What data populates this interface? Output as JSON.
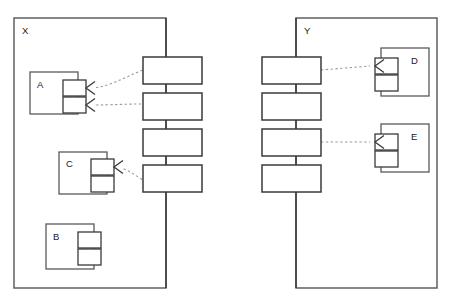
{
  "diagram": {
    "type": "uml-component-diagram",
    "canvas": {
      "width": 456,
      "height": 302,
      "background": "#ffffff"
    },
    "stroke_colors": {
      "container": "#555555",
      "node": "#3a3a3a",
      "component": "#5a5a5a",
      "connector": "#9a9a9a"
    },
    "containers": [
      {
        "id": "container-x",
        "label": "X",
        "x": 14,
        "y": 18,
        "width": 152,
        "height": 270,
        "label_x": 22,
        "label_y": 31
      },
      {
        "id": "container-y",
        "label": "Y",
        "x": 296,
        "y": 18,
        "width": 141,
        "height": 270,
        "label_x": 304,
        "label_y": 31
      }
    ],
    "spines": [
      {
        "id": "spine-x",
        "container": "container-x",
        "x": 166,
        "top_y": 18,
        "bottom_y": 288,
        "nodes": [
          {
            "id": "node-x1",
            "x": 143,
            "y": 57,
            "width": 59,
            "height": 27
          },
          {
            "id": "node-x2",
            "x": 143,
            "y": 93,
            "width": 59,
            "height": 27
          },
          {
            "id": "node-x3",
            "x": 143,
            "y": 129,
            "width": 59,
            "height": 27
          },
          {
            "id": "node-x4",
            "x": 143,
            "y": 165,
            "width": 59,
            "height": 27
          }
        ]
      },
      {
        "id": "spine-y",
        "container": "container-y",
        "x": 296,
        "top_y": 18,
        "bottom_y": 288,
        "nodes": [
          {
            "id": "node-y1",
            "x": 262,
            "y": 57,
            "width": 59,
            "height": 27
          },
          {
            "id": "node-y2",
            "x": 262,
            "y": 93,
            "width": 59,
            "height": 27
          },
          {
            "id": "node-y3",
            "x": 262,
            "y": 129,
            "width": 59,
            "height": 27
          },
          {
            "id": "node-y4",
            "x": 262,
            "y": 165,
            "width": 59,
            "height": 27
          }
        ]
      }
    ],
    "components": [
      {
        "id": "component-a",
        "label": "A",
        "x": 30,
        "y": 72,
        "width": 48,
        "height": 42,
        "label_x": 37,
        "label_y": 85,
        "ports": [
          {
            "id": "port-a-1",
            "x": 63,
            "y": 80,
            "width": 23,
            "height": 16
          },
          {
            "id": "port-a-2",
            "x": 63,
            "y": 97,
            "width": 23,
            "height": 16
          }
        ],
        "sockets": [
          {
            "id": "socket-a-1",
            "x": 86,
            "y": 88,
            "direction": "left"
          },
          {
            "id": "socket-a-2",
            "x": 86,
            "y": 105,
            "direction": "left"
          }
        ]
      },
      {
        "id": "component-b",
        "label": "B",
        "x": 46,
        "y": 224,
        "width": 48,
        "height": 45,
        "label_x": 53,
        "label_y": 237,
        "ports": [
          {
            "id": "port-b-1",
            "x": 78,
            "y": 232,
            "width": 23,
            "height": 16
          },
          {
            "id": "port-b-2",
            "x": 78,
            "y": 249,
            "width": 23,
            "height": 16
          }
        ],
        "sockets": []
      },
      {
        "id": "component-c",
        "label": "C",
        "x": 59,
        "y": 152,
        "width": 48,
        "height": 42,
        "label_x": 66,
        "label_y": 164,
        "ports": [
          {
            "id": "port-c-1",
            "x": 91,
            "y": 159,
            "width": 23,
            "height": 16
          },
          {
            "id": "port-c-2",
            "x": 91,
            "y": 176,
            "width": 23,
            "height": 16
          }
        ],
        "sockets": [
          {
            "id": "socket-c-1",
            "x": 114,
            "y": 167,
            "direction": "left"
          }
        ]
      },
      {
        "id": "component-d",
        "label": "D",
        "x": 381,
        "y": 48,
        "width": 48,
        "height": 48,
        "label_x": 411,
        "label_y": 61,
        "ports": [
          {
            "id": "port-d-1",
            "x": 375,
            "y": 58,
            "width": 23,
            "height": 16
          },
          {
            "id": "port-d-2",
            "x": 375,
            "y": 75,
            "width": 23,
            "height": 16
          }
        ],
        "sockets": [
          {
            "id": "socket-d-1",
            "x": 375,
            "y": 66,
            "direction": "left"
          }
        ]
      },
      {
        "id": "component-e",
        "label": "E",
        "x": 381,
        "y": 124,
        "width": 48,
        "height": 48,
        "label_x": 411,
        "label_y": 137,
        "ports": [
          {
            "id": "port-e-1",
            "x": 375,
            "y": 134,
            "width": 23,
            "height": 16
          },
          {
            "id": "port-e-2",
            "x": 375,
            "y": 151,
            "width": 23,
            "height": 16
          }
        ],
        "sockets": [
          {
            "id": "socket-e-1",
            "x": 375,
            "y": 142,
            "direction": "left"
          }
        ]
      }
    ],
    "connectors": [
      {
        "id": "connector-a1-to-node-x1",
        "from": "socket-a-1",
        "to": "node-x1",
        "path": "M 91 88 C 110 87 122 78 143 70"
      },
      {
        "id": "connector-a2-to-node-x2",
        "from": "socket-a-2",
        "to": "node-x2",
        "path": "M 91 105 C 112 105 124 104 143 104"
      },
      {
        "id": "connector-c1-to-node-x4",
        "from": "socket-c-1",
        "to": "node-x4",
        "path": "M 119 167 C 128 170 135 175 143 180"
      },
      {
        "id": "connector-node-y1-to-d",
        "from": "node-y1",
        "to": "socket-d-1",
        "path": "M 321 70 L 370 66"
      },
      {
        "id": "connector-node-y3-to-e",
        "from": "node-y3",
        "to": "socket-e-1",
        "path": "M 321 142 L 370 142"
      }
    ]
  }
}
